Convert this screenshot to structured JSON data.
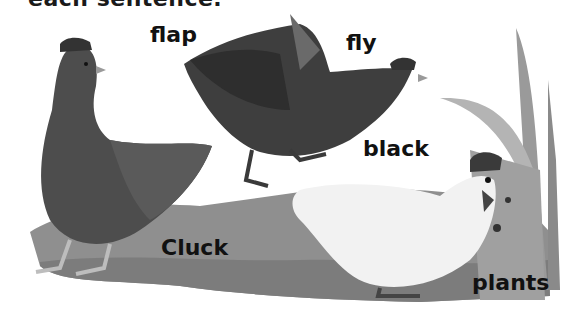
{
  "heading": {
    "text": "each sentence."
  },
  "illustration": {
    "description": "Painted scene of three hens on grass with a corn plant",
    "colors": {
      "ground": "#8f8f8f",
      "ground_dark": "#767676",
      "dark_hen": "#4a4a4a",
      "dark_hen_shadow": "#2f2f2f",
      "white_hen": "#f2f2f2",
      "comb": "#3a3a3a",
      "plant": "#a9a9a9"
    }
  },
  "labels": [
    {
      "id": "flap",
      "text": "flap",
      "x": 150,
      "y": 24
    },
    {
      "id": "fly",
      "text": "fly",
      "x": 346,
      "y": 32
    },
    {
      "id": "black",
      "text": "black",
      "x": 363,
      "y": 138
    },
    {
      "id": "cluck",
      "text": "Cluck",
      "x": 161,
      "y": 237
    },
    {
      "id": "plants",
      "text": "plants",
      "x": 472,
      "y": 272
    }
  ]
}
